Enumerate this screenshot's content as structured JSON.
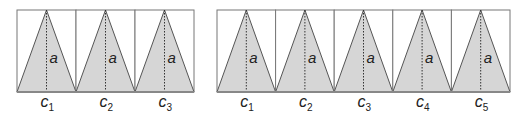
{
  "colors": {
    "fill": "#d6d6d6",
    "stroke": "#555555",
    "border": "#777777",
    "text": "#222222"
  },
  "figures": [
    {
      "name": "three-triangle-figure",
      "x": 17,
      "y": 10,
      "width": 177,
      "height": 82,
      "height_label": "a",
      "cells": [
        {
          "label": "c",
          "subscript": "1"
        },
        {
          "label": "c",
          "subscript": "2"
        },
        {
          "label": "c",
          "subscript": "3"
        }
      ]
    },
    {
      "name": "five-triangle-figure",
      "x": 217,
      "y": 10,
      "width": 293,
      "height": 82,
      "height_label": "a",
      "cells": [
        {
          "label": "c",
          "subscript": "1"
        },
        {
          "label": "c",
          "subscript": "2"
        },
        {
          "label": "c",
          "subscript": "3"
        },
        {
          "label": "c",
          "subscript": "4"
        },
        {
          "label": "c",
          "subscript": "5"
        }
      ]
    }
  ]
}
